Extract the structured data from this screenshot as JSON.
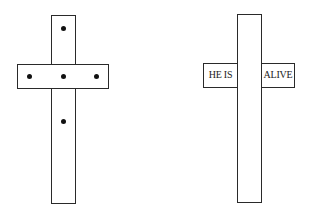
{
  "figure": {
    "left_cross": {
      "description": "cross with five dots",
      "dots": 5
    },
    "right_cross": {
      "left_label": "HE IS",
      "right_label": "ALIVE"
    }
  }
}
